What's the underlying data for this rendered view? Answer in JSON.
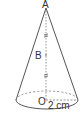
{
  "diagram": {
    "type": "cone",
    "labels": {
      "apex": "A",
      "midpoint": "B",
      "center": "O",
      "radius": "2 cm"
    },
    "colors": {
      "stroke": "#555555",
      "text": "#333333"
    }
  }
}
